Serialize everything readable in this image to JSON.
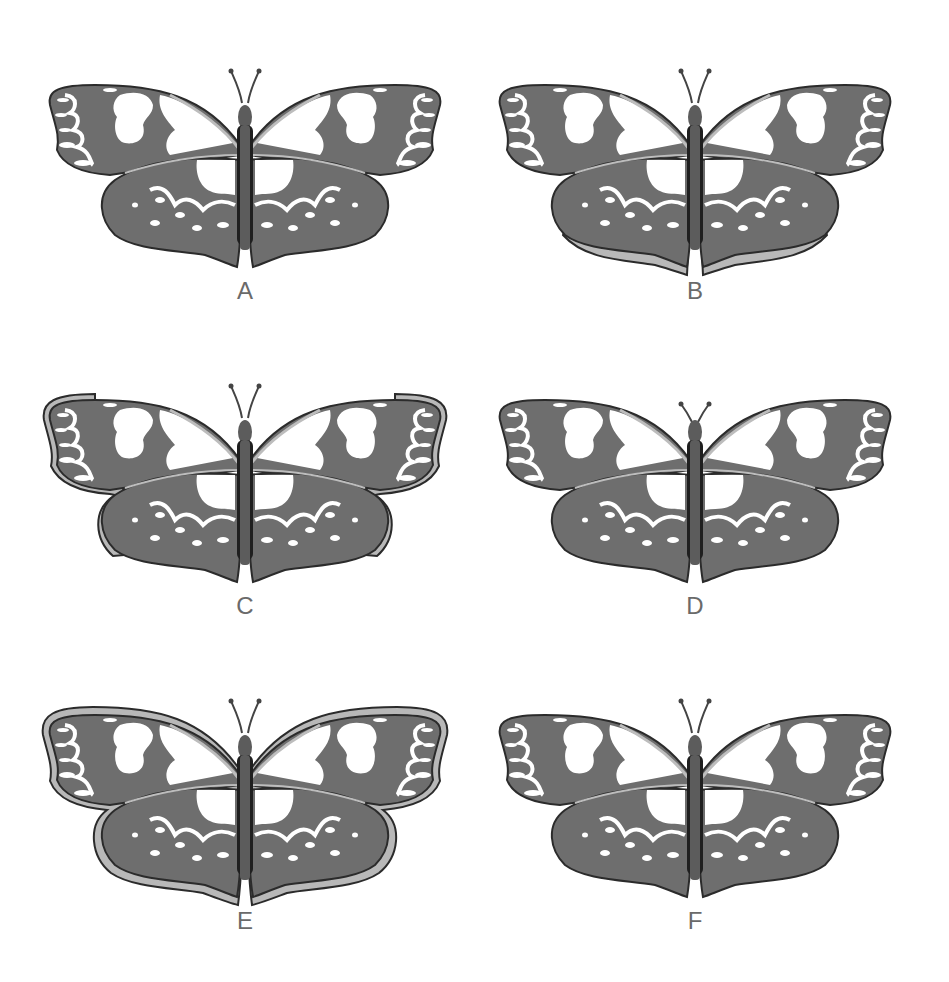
{
  "colors": {
    "wing": "#6e6e6e",
    "wing_outline": "#2b2b2b",
    "body": "#5c5c5c",
    "body_dark": "#1f1f1f",
    "vein_light": "#bdbdbd",
    "spots": "#ffffff",
    "rim_light": "#b8b8b8",
    "label": "#6a6a6a"
  },
  "options": [
    {
      "label": "A",
      "variant": "plain"
    },
    {
      "label": "B",
      "variant": "hindwing-bottom-light-edge"
    },
    {
      "label": "C",
      "variant": "outer-edge-light-border"
    },
    {
      "label": "D",
      "variant": "short-antennae"
    },
    {
      "label": "E",
      "variant": "full-light-border"
    },
    {
      "label": "F",
      "variant": "plain"
    }
  ]
}
